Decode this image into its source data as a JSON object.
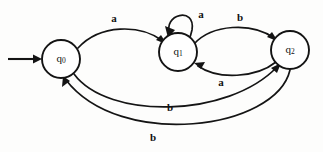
{
  "diagram": {
    "kind": "finite-state-automaton",
    "title": "",
    "states": [
      {
        "id": "q0",
        "label": "q",
        "sub": "0",
        "cx": 61,
        "cy": 59,
        "r": 19,
        "initial": true
      },
      {
        "id": "q1",
        "label": "q",
        "sub": "1",
        "cx": 178,
        "cy": 52,
        "r": 19,
        "initial": false
      },
      {
        "id": "q2",
        "label": "q",
        "sub": "2",
        "cx": 290,
        "cy": 50,
        "r": 19,
        "initial": false
      }
    ],
    "start_arrow": {
      "name": "start-arrow",
      "from_x": 8,
      "to_x": 42,
      "y": 59
    },
    "transitions": [
      {
        "id": "t1",
        "from": "q0",
        "to": "q1",
        "symbol": "a",
        "label_x": 114,
        "label_y": 19,
        "shape": "arc-top"
      },
      {
        "id": "t2",
        "from": "q1",
        "to": "q1",
        "symbol": "a",
        "label_x": 201,
        "label_y": 15,
        "shape": "self-loop"
      },
      {
        "id": "t3",
        "from": "q1",
        "to": "q2",
        "symbol": "b",
        "label_x": 240,
        "label_y": 18,
        "shape": "arc-top"
      },
      {
        "id": "t4",
        "from": "q2",
        "to": "q1",
        "symbol": "a",
        "label_x": 221,
        "label_y": 83,
        "shape": "arc-bottom"
      },
      {
        "id": "t5",
        "from": "q0",
        "to": "q2",
        "symbol": "b",
        "label_x": 170,
        "label_y": 108,
        "shape": "arc-long-upper"
      },
      {
        "id": "t6",
        "from": "q2",
        "to": "q0",
        "symbol": "b",
        "label_x": 153,
        "label_y": 138,
        "shape": "arc-long-lower"
      }
    ],
    "colors": {
      "ink": "#141414",
      "paper": "#fdfdfc"
    }
  }
}
